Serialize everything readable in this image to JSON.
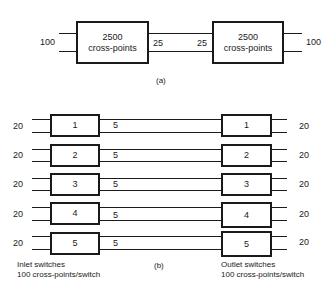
{
  "part_a": {
    "left_box": {
      "line1": "2500",
      "line2": "cross-points"
    },
    "right_box": {
      "line1": "2500",
      "line2": "cross-points"
    },
    "left_input": "100",
    "link_left": "25",
    "link_right": "25",
    "right_output": "100",
    "caption": "(a)"
  },
  "part_b": {
    "rows": [
      {
        "in": "20",
        "inlet": "1",
        "link": "5",
        "outlet": "1",
        "out": "20"
      },
      {
        "in": "20",
        "inlet": "2",
        "link": "5",
        "outlet": "2",
        "out": "20"
      },
      {
        "in": "20",
        "inlet": "3",
        "link": "5",
        "outlet": "3",
        "out": "20"
      },
      {
        "in": "20",
        "inlet": "4",
        "link": "5",
        "outlet": "4",
        "out": "20"
      },
      {
        "in": "20",
        "inlet": "5",
        "link": "5",
        "outlet": "5",
        "out": "20"
      }
    ],
    "inlet_caption": {
      "line1": "Inlet switches",
      "line2": "100 cross-points/switch"
    },
    "outlet_caption": {
      "line1": "Outlet switches",
      "line2": "100 cross-points/switch"
    },
    "caption": "(b)"
  }
}
